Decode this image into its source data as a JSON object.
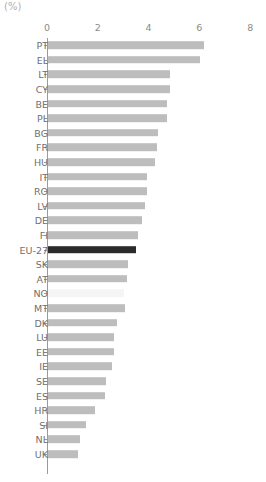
{
  "unit_label": "(%)",
  "axis": {
    "ticks": [
      0,
      2,
      4,
      6,
      8
    ],
    "min": 0,
    "max": 8
  },
  "colors": {
    "bar_default": "#bdbdbd",
    "bar_highlight": "#2b2b2b",
    "bar_faint": "#f5f5f5",
    "axis": "#9a9a9a",
    "text": "#6f6f6f",
    "tick_text": "#8a8a8a",
    "unit_text": "#b0b0b0",
    "background": "#ffffff"
  },
  "chart_data": {
    "type": "bar",
    "orientation": "horizontal",
    "title": "",
    "subtitle": "",
    "xlabel": "(%)",
    "ylabel": "",
    "xlim": [
      0,
      8
    ],
    "ylim": null,
    "grid": false,
    "legend": null,
    "xticks": [
      0,
      2,
      4,
      6,
      8
    ],
    "categories": [
      "PT",
      "EL",
      "LT",
      "CY",
      "BE",
      "PL",
      "BG",
      "FR",
      "HU",
      "IT",
      "RO",
      "LV",
      "DE",
      "FI",
      "EU-27",
      "SK",
      "AT",
      "NO",
      "MT",
      "DK",
      "LU",
      "EE",
      "IE",
      "SE",
      "ES",
      "HR",
      "SI",
      "NL",
      "UK"
    ],
    "values": [
      6.15,
      6.0,
      4.8,
      4.8,
      4.7,
      4.7,
      4.35,
      4.3,
      4.2,
      3.9,
      3.9,
      3.8,
      3.7,
      3.55,
      3.45,
      3.15,
      3.1,
      3.0,
      3.05,
      2.7,
      2.6,
      2.6,
      2.5,
      2.3,
      2.25,
      1.85,
      1.5,
      1.25,
      1.2
    ],
    "highlight_category": "EU-27",
    "faint_category": "NO"
  }
}
